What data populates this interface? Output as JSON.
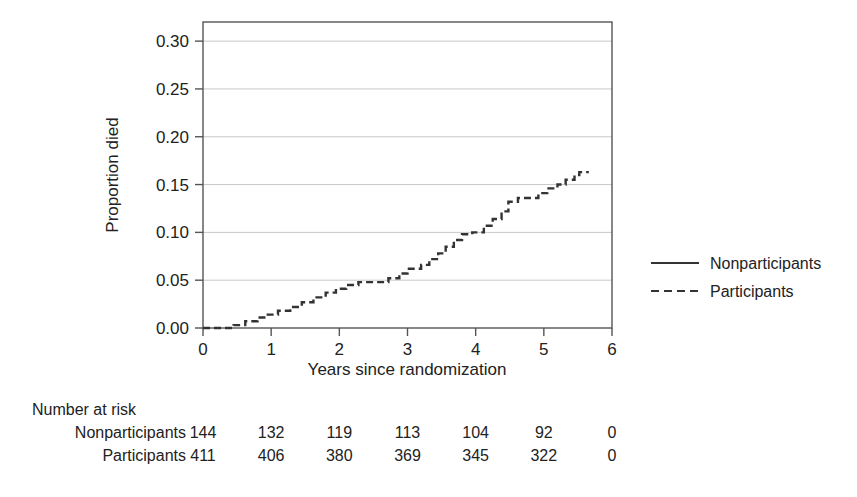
{
  "chart_data": {
    "type": "line",
    "title": "",
    "xlabel": "Years since randomization",
    "ylabel": "Proportion died",
    "xlim": [
      0,
      6
    ],
    "ylim": [
      0,
      0.32
    ],
    "xticks": [
      "0",
      "1",
      "2",
      "3",
      "4",
      "5",
      "6"
    ],
    "xtick_values": [
      0,
      1,
      2,
      3,
      4,
      5,
      6
    ],
    "yticks": [
      "0.00",
      "0.05",
      "0.10",
      "0.15",
      "0.20",
      "0.25",
      "0.30"
    ],
    "ytick_values": [
      0.0,
      0.05,
      0.1,
      0.15,
      0.2,
      0.25,
      0.3
    ],
    "grid": "horizontal",
    "legend_position": "right",
    "series": [
      {
        "name": "Nonparticipants",
        "style": "solid",
        "color": "#333333",
        "points": []
      },
      {
        "name": "Participants",
        "style": "dashed",
        "color": "#333333",
        "points": [
          [
            0.0,
            0.0
          ],
          [
            0.45,
            0.0
          ],
          [
            0.45,
            0.003
          ],
          [
            0.62,
            0.003
          ],
          [
            0.62,
            0.007
          ],
          [
            0.8,
            0.007
          ],
          [
            0.8,
            0.011
          ],
          [
            0.95,
            0.011
          ],
          [
            0.95,
            0.014
          ],
          [
            1.1,
            0.014
          ],
          [
            1.1,
            0.018
          ],
          [
            1.28,
            0.018
          ],
          [
            1.28,
            0.022
          ],
          [
            1.45,
            0.022
          ],
          [
            1.45,
            0.027
          ],
          [
            1.62,
            0.027
          ],
          [
            1.62,
            0.032
          ],
          [
            1.8,
            0.032
          ],
          [
            1.8,
            0.037
          ],
          [
            1.95,
            0.037
          ],
          [
            1.95,
            0.041
          ],
          [
            2.1,
            0.041
          ],
          [
            2.1,
            0.045
          ],
          [
            2.28,
            0.045
          ],
          [
            2.28,
            0.048
          ],
          [
            2.72,
            0.048
          ],
          [
            2.72,
            0.052
          ],
          [
            2.88,
            0.052
          ],
          [
            2.88,
            0.057
          ],
          [
            3.0,
            0.057
          ],
          [
            3.0,
            0.062
          ],
          [
            3.2,
            0.062
          ],
          [
            3.2,
            0.066
          ],
          [
            3.32,
            0.066
          ],
          [
            3.32,
            0.072
          ],
          [
            3.45,
            0.072
          ],
          [
            3.45,
            0.078
          ],
          [
            3.56,
            0.078
          ],
          [
            3.56,
            0.085
          ],
          [
            3.68,
            0.085
          ],
          [
            3.68,
            0.092
          ],
          [
            3.8,
            0.092
          ],
          [
            3.8,
            0.098
          ],
          [
            3.95,
            0.098
          ],
          [
            3.95,
            0.1
          ],
          [
            4.12,
            0.1
          ],
          [
            4.12,
            0.107
          ],
          [
            4.25,
            0.107
          ],
          [
            4.25,
            0.114
          ],
          [
            4.38,
            0.114
          ],
          [
            4.38,
            0.122
          ],
          [
            4.48,
            0.122
          ],
          [
            4.48,
            0.132
          ],
          [
            4.62,
            0.132
          ],
          [
            4.62,
            0.136
          ],
          [
            4.92,
            0.136
          ],
          [
            4.92,
            0.141
          ],
          [
            5.05,
            0.141
          ],
          [
            5.05,
            0.146
          ],
          [
            5.2,
            0.146
          ],
          [
            5.2,
            0.15
          ],
          [
            5.32,
            0.15
          ],
          [
            5.32,
            0.155
          ],
          [
            5.45,
            0.155
          ],
          [
            5.45,
            0.16
          ],
          [
            5.52,
            0.16
          ],
          [
            5.52,
            0.163
          ],
          [
            5.66,
            0.163
          ]
        ]
      }
    ]
  },
  "legend": {
    "entries": [
      {
        "label": "Nonparticipants",
        "style": "solid"
      },
      {
        "label": "Participants",
        "style": "dashed"
      }
    ]
  },
  "risk_table": {
    "header": "Number at risk",
    "rows": [
      {
        "label": "Nonparticipants",
        "values": [
          "144",
          "132",
          "119",
          "113",
          "104",
          "92",
          "0"
        ]
      },
      {
        "label": "Participants",
        "values": [
          "411",
          "406",
          "380",
          "369",
          "345",
          "322",
          "0"
        ]
      }
    ]
  },
  "colors": {
    "line": "#333333",
    "grid": "#c8c8c8",
    "axis": "#555555",
    "text": "#222222"
  }
}
